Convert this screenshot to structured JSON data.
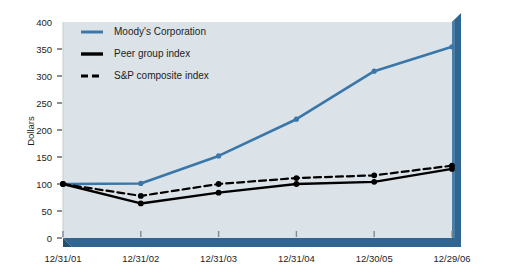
{
  "chart_data": {
    "type": "line",
    "title": "",
    "xlabel": "",
    "ylabel": "Dollars",
    "categories": [
      "12/31/01",
      "12/31/02",
      "12/31/03",
      "12/31/04",
      "12/30/05",
      "12/29/06"
    ],
    "ylim": [
      0,
      400
    ],
    "yticks": [
      0,
      50,
      100,
      150,
      200,
      250,
      300,
      350,
      400
    ],
    "grid": false,
    "legend_position": "top-left",
    "series": [
      {
        "name": "Moody's Corporation",
        "values": [
          100,
          101,
          152,
          220,
          309,
          354
        ],
        "color": "#3a77a8",
        "style": "solid",
        "marker": "circle"
      },
      {
        "name": "Peer group index",
        "values": [
          100,
          64,
          84,
          100,
          104,
          128
        ],
        "color": "#000000",
        "style": "solid",
        "marker": "circle"
      },
      {
        "name": "S&P composite index",
        "values": [
          100,
          78,
          100,
          111,
          116,
          134
        ],
        "color": "#000000",
        "style": "dashed",
        "marker": "circle"
      }
    ]
  },
  "colors": {
    "plot_background": "#dbe3e9",
    "axis_blue": "#2f6590",
    "axis_blue_dark": "#24516f",
    "axis_blue_light": "#4a7ea5",
    "moodys_line": "#3a77a8",
    "index_line": "#000000",
    "page_background": "#ffffff",
    "text": "#1d1d1d"
  },
  "legend": {
    "items": [
      {
        "label": "Moody's Corporation",
        "swatch": "solid-blue"
      },
      {
        "label": "Peer group index",
        "swatch": "solid-black"
      },
      {
        "label": "S&P composite index",
        "swatch": "dashed-black"
      }
    ]
  },
  "axes": {
    "y_title": "Dollars",
    "y_tick_labels": [
      "400",
      "350",
      "300",
      "250",
      "200",
      "150",
      "100",
      "50",
      "0"
    ],
    "x_tick_labels": [
      "12/31/01",
      "12/31/02",
      "12/31/03",
      "12/31/04",
      "12/30/05",
      "12/29/06"
    ]
  }
}
